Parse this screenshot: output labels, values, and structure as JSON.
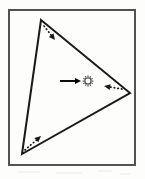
{
  "figure": {
    "background_color": "#fdfdfc",
    "frame": {
      "label": "rectangular border frame",
      "stroke_color": "#4a4a4a",
      "stroke_width": 2,
      "x": 8,
      "y": 9,
      "width": 128,
      "height": 157
    },
    "triangle": {
      "label": "triangle outline",
      "stroke_color": "#1a1a1a",
      "stroke_width": 2,
      "fill": "none",
      "vertices": [
        {
          "name": "top-vertex",
          "x": 41,
          "y": 20
        },
        {
          "name": "right-vertex",
          "x": 130,
          "y": 93
        },
        {
          "name": "bottom-left-vertex",
          "x": 22,
          "y": 154
        }
      ],
      "path": "M 41 20 L 130 93 L 22 154 Z"
    },
    "dotted_arrows": [
      {
        "name": "top-edge-arrow",
        "description": "dotted arrow at top vertex pointing down-right along upper edge",
        "style": "dotted",
        "stroke_color": "#1a1a1a",
        "from_x": 44,
        "from_y": 26,
        "to_x": 55,
        "to_y": 40,
        "direction": "down-right"
      },
      {
        "name": "right-edge-arrow",
        "description": "dotted arrow near right vertex pointing left toward interior",
        "style": "dotted",
        "stroke_color": "#1a1a1a",
        "from_x": 122,
        "from_y": 89,
        "to_x": 104,
        "to_y": 86,
        "direction": "left"
      },
      {
        "name": "bottom-left-edge-arrow",
        "description": "dotted arrow at bottom-left vertex pointing up-right along lower edge",
        "style": "dotted",
        "stroke_color": "#1a1a1a",
        "from_x": 25,
        "from_y": 150,
        "to_x": 41,
        "to_y": 136,
        "direction": "up-right"
      }
    ],
    "solid_arrow": {
      "name": "center-pointer-arrow",
      "description": "solid horizontal arrow pointing right at the central marker",
      "style": "solid",
      "stroke_color": "#000000",
      "from_x": 60,
      "from_y": 81,
      "to_x": 81,
      "to_y": 81,
      "direction": "right"
    },
    "center_marker": {
      "name": "sun-burst-marker",
      "description": "small circle with radiating tick marks near the triangle centroid",
      "stroke_color": "#555555",
      "cx": 88,
      "cy": 81,
      "inner_radius": 3.1,
      "outer_radius": 5.4,
      "ray_count": 12
    }
  }
}
